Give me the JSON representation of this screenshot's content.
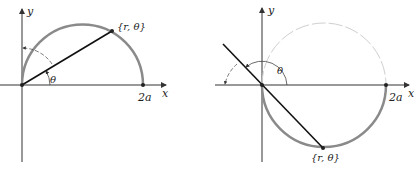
{
  "figure": {
    "left_panel": {
      "y_axis_label": "y",
      "x_axis_label": "x",
      "point_label": "{r, θ}",
      "angle_label": "θ",
      "intercept_label": "2a"
    },
    "right_panel": {
      "y_axis_label": "y",
      "x_axis_label": "x",
      "point_label": "{r, θ}",
      "angle_label": "θ",
      "intercept_label": "2a"
    },
    "colors": {
      "curve": "#8a8a8a",
      "ghost_curve": "#cfcfcf",
      "axes": "#333333",
      "ray": "#111111"
    }
  }
}
